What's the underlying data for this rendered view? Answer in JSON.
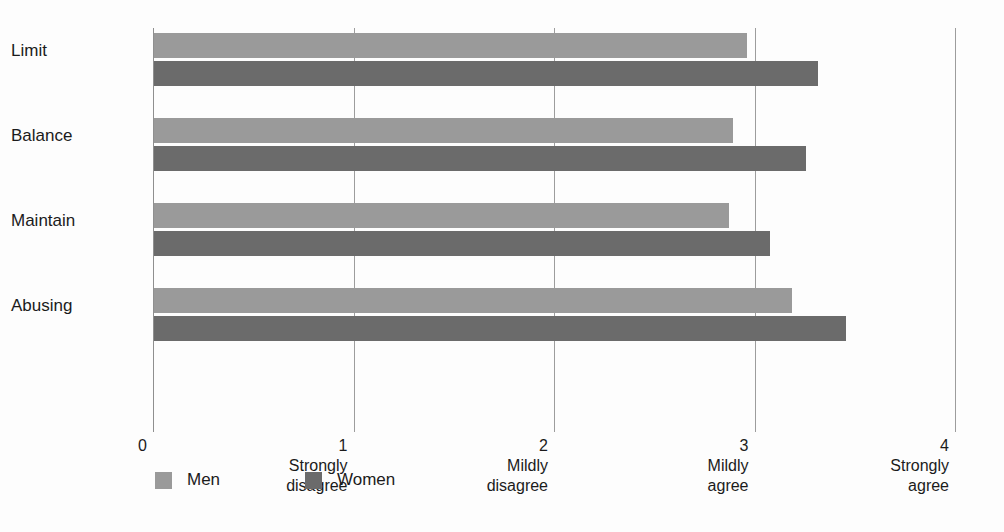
{
  "chart_data": {
    "type": "bar",
    "orientation": "horizontal",
    "title": "",
    "xlabel": "",
    "ylabel": "",
    "xlim": [
      0,
      4
    ],
    "grid": true,
    "grid_axis": "x",
    "legend_position": "bottom-left",
    "categories": [
      "Limit",
      "Balance",
      "Maintain",
      "Abusing"
    ],
    "series": [
      {
        "name": "Men",
        "color": "#9a9a9a",
        "values": [
          2.96,
          2.89,
          2.87,
          3.18
        ]
      },
      {
        "name": "Women",
        "color": "#6b6b6b",
        "values": [
          3.31,
          3.25,
          3.07,
          3.45
        ]
      }
    ],
    "xticks": [
      {
        "value": 0,
        "num": "0",
        "line1": "",
        "line2": ""
      },
      {
        "value": 1,
        "num": "1",
        "line1": "Strongly",
        "line2": "disagree"
      },
      {
        "value": 2,
        "num": "2",
        "line1": "Mildly",
        "line2": "disagree"
      },
      {
        "value": 3,
        "num": "3",
        "line1": "Mildly",
        "line2": "agree"
      },
      {
        "value": 4,
        "num": "4",
        "line1": "Strongly",
        "line2": "agree"
      }
    ]
  },
  "colors": {
    "men": "#9a9a9a",
    "women": "#6b6b6b",
    "gridline": "#9d9d9d",
    "axis": "#8f8f8f",
    "text": "#1b1b1b",
    "background": "#fdfdfd"
  },
  "legend": {
    "items": [
      {
        "label": "Men",
        "color": "#9a9a9a"
      },
      {
        "label": "Women",
        "color": "#6b6b6b"
      }
    ]
  }
}
